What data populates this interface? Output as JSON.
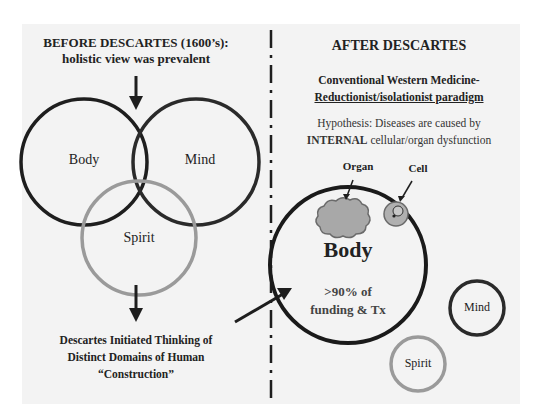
{
  "left": {
    "title_line1": "BEFORE DESCARTES (1600’s):",
    "title_line2": "holistic view was prevalent",
    "venn": {
      "body_label": "Body",
      "mind_label": "Mind",
      "spirit_label": "Spirit"
    },
    "caption_line1": "Descartes Initiated Thinking of",
    "caption_line2": "Distinct Domains of Human",
    "caption_line3": "“Construction”"
  },
  "right": {
    "title": "AFTER DESCARTES",
    "subtitle_line1": "Conventional Western Medicine-",
    "subtitle_line2": "Reductionist/isolationist paradigm",
    "hypothesis_line1": "Hypothesis: Diseases are caused by",
    "hypothesis_line2_bold": "INTERNAL",
    "hypothesis_line2_rest": " cellular/organ dysfunction",
    "organ_label": "Organ",
    "cell_label": "Cell",
    "body_label": "Body",
    "body_sub_line1": ">90% of",
    "body_sub_line2": "funding & Tx",
    "mind_label": "Mind",
    "spirit_label": "Spirit"
  },
  "colors": {
    "dark_ring": "#1e1e1e",
    "spirit_ring": "#9a9a9a",
    "organ_fill": "#a8a8a8",
    "cell_fill": "#b0b0b0",
    "panel_bg": "#f3f3f3"
  }
}
